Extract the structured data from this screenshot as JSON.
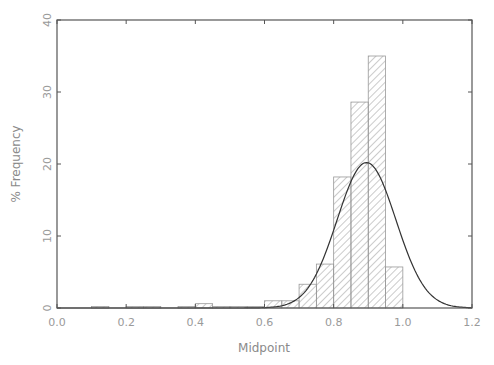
{
  "chart_data": {
    "type": "bar",
    "title": "",
    "xlabel": "Midpoint",
    "ylabel": "% Frequency",
    "xlim": [
      0.0,
      1.2
    ],
    "ylim": [
      0,
      40
    ],
    "grid": false,
    "legend": null,
    "bin_width": 0.05,
    "x_ticks": [
      "0.0",
      "0.2",
      "0.4",
      "0.6",
      "0.8",
      "1.0",
      "1.2"
    ],
    "y_ticks": [
      "0",
      "10",
      "20",
      "30",
      "40"
    ],
    "bins": [
      {
        "left": 0.1,
        "value": 0.2
      },
      {
        "left": 0.2,
        "value": 0.2
      },
      {
        "left": 0.25,
        "value": 0.2
      },
      {
        "left": 0.35,
        "value": 0.2
      },
      {
        "left": 0.4,
        "value": 0.6
      },
      {
        "left": 0.45,
        "value": 0.2
      },
      {
        "left": 0.5,
        "value": 0.2
      },
      {
        "left": 0.55,
        "value": 0.2
      },
      {
        "left": 0.6,
        "value": 1.0
      },
      {
        "left": 0.65,
        "value": 1.0
      },
      {
        "left": 0.7,
        "value": 3.3
      },
      {
        "left": 0.75,
        "value": 6.1
      },
      {
        "left": 0.8,
        "value": 18.2
      },
      {
        "left": 0.85,
        "value": 28.6
      },
      {
        "left": 0.9,
        "value": 35.0
      },
      {
        "left": 0.95,
        "value": 5.7
      }
    ],
    "overlay": {
      "type": "normal_curve",
      "mean": 0.895,
      "peak": 20.2,
      "sd": 0.085
    }
  }
}
